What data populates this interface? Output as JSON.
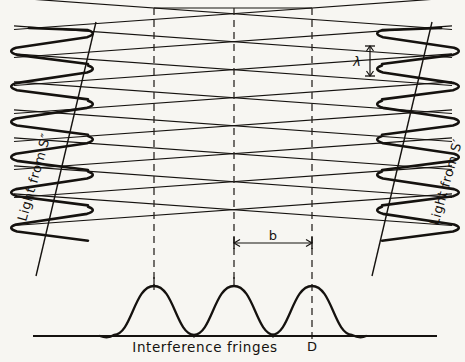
{
  "figure": {
    "background_color": "#f7f6f2",
    "ink_color": "#15120f",
    "caption": "Interference   fringes",
    "labels": {
      "left_source": "Light  from  S″",
      "right_source": "Light  from  S′",
      "wavelength": "λ",
      "fringe_spacing": "b",
      "screen_point": "D"
    }
  },
  "geometry": {
    "dashed_lines_x": [
      154,
      234,
      312
    ],
    "dashed_top_y": 8,
    "dashed_bottom_y": 290,
    "baseline": {
      "x1": 33,
      "x2": 437,
      "y": 336
    },
    "lattice": {
      "left_edge_x": 14,
      "right_edge_x": 452,
      "top_y": 8,
      "rows": 8,
      "row_spacing": 28,
      "slope": 0.072
    },
    "wave_left": {
      "x_center": 52,
      "top_y": 28,
      "bottom_y": 240,
      "amplitude": 42,
      "cycles": 6
    },
    "wave_right": {
      "x_center": 418,
      "top_y": 28,
      "bottom_y": 240,
      "amplitude": 42,
      "cycles": 6
    },
    "ray_left": {
      "x1": 96,
      "y1": 22,
      "x2": 36,
      "y2": 276
    },
    "ray_right": {
      "x1": 372,
      "y1": 276,
      "x2": 432,
      "y2": 22
    },
    "lambda_marker": {
      "x": 370,
      "y_top": 46,
      "y_bottom": 76
    },
    "b_marker": {
      "x1": 234,
      "x2": 312,
      "y": 243
    },
    "fringes": {
      "peaks_x": [
        154,
        234,
        312
      ],
      "peak_y": 286,
      "base_y": 336,
      "half_width": 40
    }
  },
  "chart_data": {
    "type": "line",
    "title": "Interference   fringes",
    "xlabel": "",
    "ylabel": "Intensity",
    "x": [
      74,
      114,
      154,
      194,
      234,
      274,
      312,
      352,
      392
    ],
    "values": [
      0,
      0,
      1,
      0,
      1,
      0,
      1,
      0,
      0
    ],
    "annotations": [
      {
        "text": "b",
        "meaning": "fringe spacing between adjacent maxima",
        "x_from": 234,
        "x_to": 312
      },
      {
        "text": "λ",
        "meaning": "wavelength separation between successive wavefronts"
      },
      {
        "text": "D",
        "meaning": "point on screen at third maximum",
        "x": 312
      }
    ],
    "legend": [
      "Light  from  S″",
      "Light  from  S′"
    ]
  }
}
